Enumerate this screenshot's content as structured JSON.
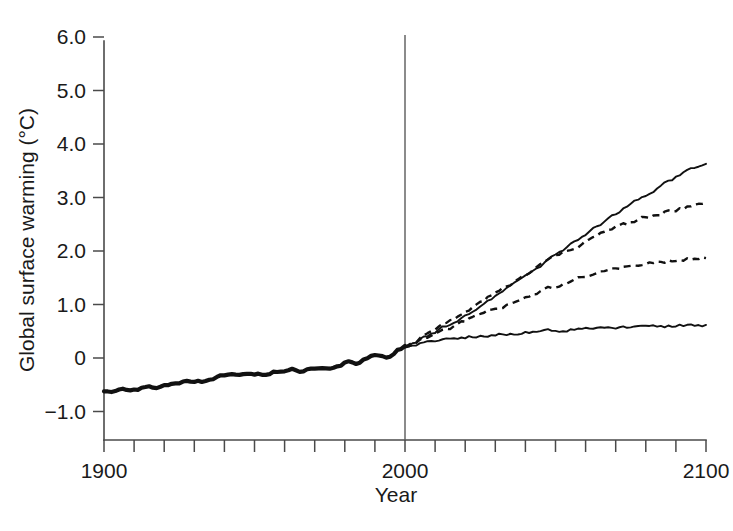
{
  "chart_data": {
    "type": "line",
    "title": "",
    "xlabel": "Year",
    "ylabel": "Global surface warming (°C)",
    "xlim": [
      1900,
      2100
    ],
    "ylim": [
      -1.0,
      6.0
    ],
    "grid": false,
    "legend": "none",
    "x_tick_labels": [
      "1900",
      "2000",
      "2100"
    ],
    "x_tick_values": [
      1900,
      2000,
      2100
    ],
    "x_minor_tick_step": 10,
    "y_tick_labels": [
      "6.0",
      "5.0",
      "4.0",
      "3.0",
      "2.0",
      "1.0",
      "0",
      "−1.0"
    ],
    "y_tick_values": [
      6.0,
      5.0,
      4.0,
      3.0,
      2.0,
      1.0,
      0,
      -1.0
    ],
    "annotations": [
      {
        "name": "year-2000-reference-line",
        "type": "vline",
        "x": 2000,
        "label": ""
      }
    ],
    "series": [
      {
        "name": "Observed historical warming",
        "style": "thick-solid",
        "x_start": 1900,
        "x_end": 2000,
        "y_start": -0.6,
        "y_end": 0.22,
        "values": [
          [
            1900,
            -0.6
          ],
          [
            1903,
            -0.66
          ],
          [
            1906,
            -0.6
          ],
          [
            1909,
            -0.63
          ],
          [
            1912,
            -0.58
          ],
          [
            1915,
            -0.55
          ],
          [
            1918,
            -0.58
          ],
          [
            1921,
            -0.5
          ],
          [
            1924,
            -0.5
          ],
          [
            1927,
            -0.45
          ],
          [
            1930,
            -0.42
          ],
          [
            1933,
            -0.44
          ],
          [
            1936,
            -0.38
          ],
          [
            1939,
            -0.34
          ],
          [
            1942,
            -0.31
          ],
          [
            1945,
            -0.3
          ],
          [
            1948,
            -0.32
          ],
          [
            1951,
            -0.3
          ],
          [
            1954,
            -0.33
          ],
          [
            1957,
            -0.26
          ],
          [
            1960,
            -0.25
          ],
          [
            1963,
            -0.22
          ],
          [
            1966,
            -0.25
          ],
          [
            1969,
            -0.18
          ],
          [
            1972,
            -0.2
          ],
          [
            1975,
            -0.22
          ],
          [
            1978,
            -0.16
          ],
          [
            1981,
            -0.06
          ],
          [
            1984,
            -0.1
          ],
          [
            1987,
            -0.02
          ],
          [
            1990,
            0.04
          ],
          [
            1993,
            0.0
          ],
          [
            1996,
            0.06
          ],
          [
            1998,
            0.16
          ],
          [
            2000,
            0.22
          ]
        ]
      },
      {
        "name": "High emissions scenario (solid)",
        "style": "solid",
        "x_start": 2000,
        "x_end": 2100,
        "y_start": 0.22,
        "y_end": 3.65,
        "values": [
          [
            2000,
            0.22
          ],
          [
            2010,
            0.48
          ],
          [
            2020,
            0.8
          ],
          [
            2030,
            1.15
          ],
          [
            2040,
            1.52
          ],
          [
            2050,
            1.92
          ],
          [
            2060,
            2.32
          ],
          [
            2070,
            2.7
          ],
          [
            2080,
            3.05
          ],
          [
            2090,
            3.38
          ],
          [
            2100,
            3.65
          ]
        ]
      },
      {
        "name": "Mid-high emissions scenario (dashed)",
        "style": "dashed",
        "x_start": 2000,
        "x_end": 2100,
        "y_start": 0.22,
        "y_end": 2.88,
        "values": [
          [
            2000,
            0.22
          ],
          [
            2010,
            0.52
          ],
          [
            2020,
            0.88
          ],
          [
            2030,
            1.22
          ],
          [
            2040,
            1.56
          ],
          [
            2050,
            1.88
          ],
          [
            2060,
            2.18
          ],
          [
            2070,
            2.44
          ],
          [
            2080,
            2.63
          ],
          [
            2090,
            2.78
          ],
          [
            2100,
            2.88
          ]
        ]
      },
      {
        "name": "Mid-low emissions scenario (dashed)",
        "style": "dashed",
        "x_start": 2000,
        "x_end": 2100,
        "y_start": 0.22,
        "y_end": 1.88,
        "values": [
          [
            2000,
            0.22
          ],
          [
            2010,
            0.44
          ],
          [
            2020,
            0.68
          ],
          [
            2030,
            0.92
          ],
          [
            2040,
            1.14
          ],
          [
            2050,
            1.34
          ],
          [
            2060,
            1.52
          ],
          [
            2070,
            1.66
          ],
          [
            2080,
            1.76
          ],
          [
            2090,
            1.84
          ],
          [
            2100,
            1.88
          ]
        ]
      },
      {
        "name": "Constant composition commitment (solid)",
        "style": "solid",
        "x_start": 2000,
        "x_end": 2100,
        "y_start": 0.22,
        "y_end": 0.62,
        "values": [
          [
            2000,
            0.22
          ],
          [
            2010,
            0.32
          ],
          [
            2020,
            0.39
          ],
          [
            2030,
            0.44
          ],
          [
            2040,
            0.48
          ],
          [
            2050,
            0.51
          ],
          [
            2060,
            0.54
          ],
          [
            2070,
            0.56
          ],
          [
            2080,
            0.58
          ],
          [
            2090,
            0.6
          ],
          [
            2100,
            0.62
          ]
        ]
      }
    ]
  },
  "colors": {
    "line": "#111111",
    "axis": "#4a4a4a",
    "background": "#ffffff"
  }
}
